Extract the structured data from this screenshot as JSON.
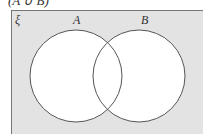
{
  "header": {
    "text": "(A ∪ B)"
  },
  "diagram": {
    "universal_symbol": "ξ",
    "sets": [
      {
        "label": "A",
        "cx": 76,
        "cy": 76,
        "r": 46
      },
      {
        "label": "B",
        "cx": 139,
        "cy": 76,
        "r": 46
      }
    ],
    "colors": {
      "background": "#e3e3e3",
      "circle_fill": "#ffffff",
      "stroke": "#555555"
    }
  }
}
